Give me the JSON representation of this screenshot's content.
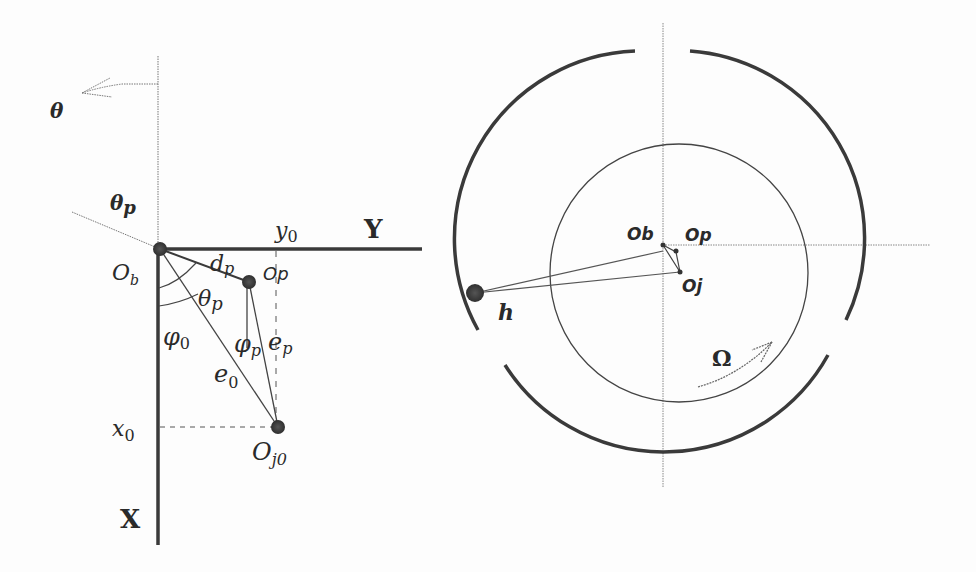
{
  "figure": {
    "left_panel": {
      "title": "Coordinate geometry of pad and journal centers",
      "labels": {
        "theta": "θ",
        "theta_p_top": "θ",
        "theta_p_top_sub": "p",
        "theta_p_mid": "θ",
        "theta_p_mid_sub": "p",
        "ob": "O",
        "ob_sub": "b",
        "op": "Op",
        "dp": "d",
        "dp_sub": "p",
        "y0": "y",
        "y0_sub": "0",
        "Y": "Y",
        "phi0": "φ",
        "phi0_sub": "0",
        "phip": "φ",
        "phip_sub": "p",
        "ep": "e",
        "ep_sub": "p",
        "e0": "e",
        "e0_sub": "0",
        "x0": "x",
        "x0_sub": "0",
        "oj0": "O",
        "oj0_sub": "j0",
        "X": "X"
      },
      "points": {
        "Ob": [
          160,
          249
        ],
        "Op": [
          249,
          282
        ],
        "Oj0": [
          278,
          427
        ]
      }
    },
    "right_panel": {
      "title": "Tilting pad bearing schematic",
      "labels": {
        "ob": "Ob",
        "op": "Op",
        "oj": "Oj",
        "h": "h",
        "omega": "Ω"
      },
      "points": {
        "Ob": [
          663,
          245
        ],
        "Op": [
          676,
          252
        ],
        "Oj": [
          680,
          272
        ],
        "pad_point": [
          475,
          293
        ]
      }
    },
    "colors": {
      "line": "#3a3a3a",
      "thin": "#555555",
      "dotted": "#777777",
      "point": "#3c3c3c"
    }
  }
}
